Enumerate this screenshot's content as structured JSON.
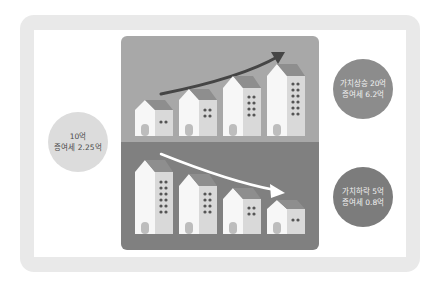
{
  "colors": {
    "frame": "#e9e9e9",
    "panel_top": "#a8a8a8",
    "panel_bottom": "#808080",
    "house_wall": "#f7f7f7",
    "house_side": "#d9d9d9",
    "roof": "#8e8e8e",
    "window": "#555555",
    "arrow_up": "#454545",
    "arrow_down": "#ffffff"
  },
  "left_circle": {
    "line1": "10억",
    "line2": "증여세 2.25억"
  },
  "rise_circle": {
    "line1": "가치상승 20억",
    "line2": "증여세 6.2억"
  },
  "fall_circle": {
    "line1": "가치하락 5억",
    "line2": "증여세 0.8억"
  },
  "illustration": {
    "top_trend": "increasing",
    "bottom_trend": "decreasing",
    "top_buildings": 4,
    "bottom_buildings": 4
  }
}
